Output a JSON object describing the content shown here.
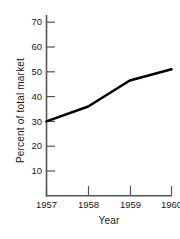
{
  "chart_data": {
    "type": "line",
    "title": "",
    "xlabel": "Year",
    "ylabel": "Percent of total market",
    "x": [
      1957,
      1958,
      1959,
      1960
    ],
    "x_tick_labels": [
      "1957",
      "1958",
      "1959",
      "1960"
    ],
    "y_tick_labels": [
      "10",
      "20",
      "30",
      "40",
      "50",
      "60",
      "70"
    ],
    "y_ticks": [
      10,
      20,
      30,
      40,
      50,
      60,
      70
    ],
    "xlim": [
      1957,
      1960
    ],
    "ylim": [
      5,
      73
    ],
    "grid": false,
    "legend": null,
    "series": [
      {
        "name": "Percent of total market",
        "values": [
          30,
          36,
          46.5,
          51
        ]
      }
    ],
    "line_color": "#000000",
    "axis_color": "#555555",
    "text_color": "#1a1a1a"
  },
  "axis": {
    "y_title": "Percent of total market",
    "x_title": "Year"
  }
}
